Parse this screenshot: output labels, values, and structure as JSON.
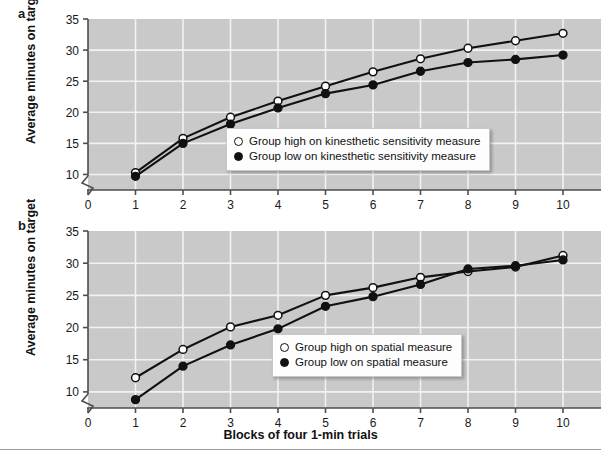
{
  "figure": {
    "background": "#ffffff",
    "plot_background": "#c9c9c9",
    "gridline_color": "#f2f2f2",
    "line_color": "#111111",
    "axis_color": "#4d4d4d"
  },
  "panels": [
    {
      "letter": "a",
      "y_axis_title": "Average minutes on target",
      "legend": {
        "series_high_label": "Group high on kinesthetic sensitivity measure",
        "series_low_label": "Group low on kinesthetic sensitivity measure"
      }
    },
    {
      "letter": "b",
      "y_axis_title": "Average minutes on target",
      "legend": {
        "series_high_label": "Group high on spatial measure",
        "series_low_label": "Group low on spatial measure"
      }
    }
  ],
  "x_axis_title": "Blocks of four 1-min trials",
  "x_tick_labels": [
    "0",
    "1",
    "2",
    "3",
    "4",
    "5",
    "6",
    "7",
    "8",
    "9",
    "10"
  ],
  "y_tick_labels": [
    "10",
    "15",
    "20",
    "25",
    "30",
    "35"
  ],
  "chart_data": [
    {
      "type": "line",
      "title": "a",
      "xlabel": "Blocks of four 1-min trials",
      "ylabel": "Average minutes on target",
      "x": [
        1,
        2,
        3,
        4,
        5,
        6,
        7,
        8,
        9,
        10
      ],
      "xlim": [
        0,
        10.8
      ],
      "ylim": [
        7.5,
        35
      ],
      "yticks": [
        10,
        15,
        20,
        25,
        30,
        35
      ],
      "xticks": [
        0,
        1,
        2,
        3,
        4,
        5,
        6,
        7,
        8,
        9,
        10
      ],
      "axis_break_y": true,
      "grid": true,
      "legend_position": "center-right-inside",
      "series": [
        {
          "name": "Group high on kinesthetic sensitivity measure",
          "marker": "open-circle",
          "values": [
            10.3,
            15.8,
            19.2,
            21.8,
            24.2,
            26.5,
            28.6,
            30.3,
            31.5,
            32.7
          ]
        },
        {
          "name": "Group low on kinesthetic sensitivity measure",
          "marker": "filled-circle",
          "values": [
            9.7,
            15.0,
            18.1,
            20.7,
            23.0,
            24.4,
            26.6,
            28.0,
            28.5,
            29.2
          ]
        }
      ]
    },
    {
      "type": "line",
      "title": "b",
      "xlabel": "Blocks of four 1-min trials",
      "ylabel": "Average minutes on target",
      "x": [
        1,
        2,
        3,
        4,
        5,
        6,
        7,
        8,
        9,
        10
      ],
      "xlim": [
        0,
        10.8
      ],
      "ylim": [
        7.5,
        35
      ],
      "yticks": [
        10,
        15,
        20,
        25,
        30,
        35
      ],
      "xticks": [
        0,
        1,
        2,
        3,
        4,
        5,
        6,
        7,
        8,
        9,
        10
      ],
      "axis_break_y": true,
      "grid": true,
      "legend_position": "center-right-inside",
      "series": [
        {
          "name": "Group high on spatial measure",
          "marker": "open-circle",
          "values": [
            12.2,
            16.6,
            20.1,
            21.9,
            25.0,
            26.2,
            27.8,
            28.7,
            29.4,
            31.2
          ]
        },
        {
          "name": "Group low on spatial measure",
          "marker": "filled-circle",
          "values": [
            8.8,
            14.0,
            17.3,
            19.8,
            23.3,
            24.8,
            26.7,
            29.1,
            29.6,
            30.5
          ]
        }
      ]
    }
  ]
}
